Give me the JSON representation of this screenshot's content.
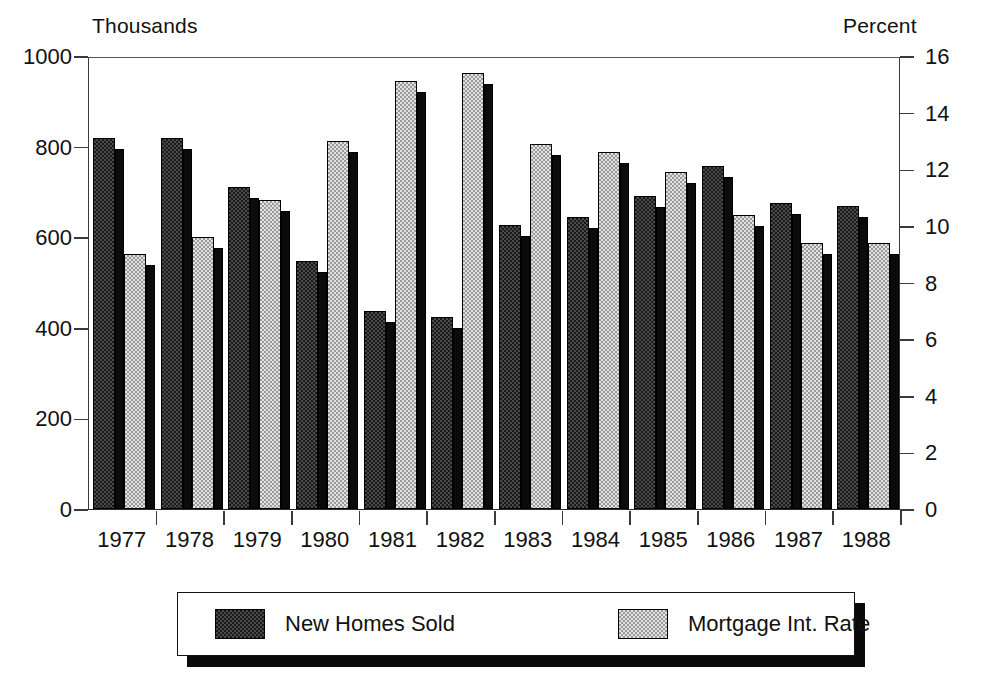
{
  "chart_data": {
    "type": "bar",
    "title": "",
    "subtitle": "",
    "xlabel": "",
    "ylabel": "Thousands",
    "y2label": "Percent",
    "grid": false,
    "legend_position": "bottom",
    "categories": [
      "1977",
      "1978",
      "1979",
      "1980",
      "1981",
      "1982",
      "1983",
      "1984",
      "1985",
      "1986",
      "1987",
      "1988"
    ],
    "ylim": [
      0,
      1000
    ],
    "y2lim": [
      0,
      16
    ],
    "yticks": [
      "0",
      "200",
      "400",
      "600",
      "800",
      "1000"
    ],
    "ytick_values": [
      0,
      200,
      400,
      600,
      800,
      1000
    ],
    "y2ticks": [
      "0",
      "2",
      "4",
      "6",
      "8",
      "10",
      "12",
      "14",
      "16"
    ],
    "y2tick_values": [
      0,
      2,
      4,
      6,
      8,
      10,
      12,
      14,
      16
    ],
    "series": [
      {
        "name": "New Homes Sold",
        "axis": "left",
        "unit": "Thousands",
        "color": "#1b1b1b",
        "values": [
          820,
          818,
          710,
          548,
          438,
          423,
          628,
          644,
          692,
          758,
          675,
          668
        ]
      },
      {
        "name": "Mortgage Int. Rate",
        "axis": "right",
        "unit": "Percent",
        "color": "#e2e2e2",
        "values": [
          9.0,
          9.6,
          10.9,
          13.0,
          15.1,
          15.4,
          12.9,
          12.6,
          11.9,
          10.4,
          9.4,
          9.4
        ]
      }
    ]
  },
  "axes": {
    "left_caption": "Thousands",
    "right_caption": "Percent",
    "left_ticks": [
      "1000",
      "800",
      "600",
      "400",
      "200",
      "0"
    ],
    "right_ticks": [
      "16",
      "14",
      "12",
      "10",
      "8",
      "6",
      "4",
      "2",
      "0"
    ],
    "x_labels": [
      "1977",
      "1978",
      "1979",
      "1980",
      "1981",
      "1982",
      "1983",
      "1984",
      "1985",
      "1986",
      "1987",
      "1988"
    ]
  },
  "legend": {
    "items": [
      {
        "label": "New Homes Sold",
        "swatch": "dark-checker-swatch"
      },
      {
        "label": "Mortgage Int. Rate",
        "swatch": "light-checker-swatch"
      }
    ]
  },
  "colors": {
    "dark_series": "#1b1b1b",
    "light_series": "#e2e2e2",
    "axis": "#3a3a3a",
    "shadow": "#0a0a0a",
    "background": "#ffffff"
  }
}
